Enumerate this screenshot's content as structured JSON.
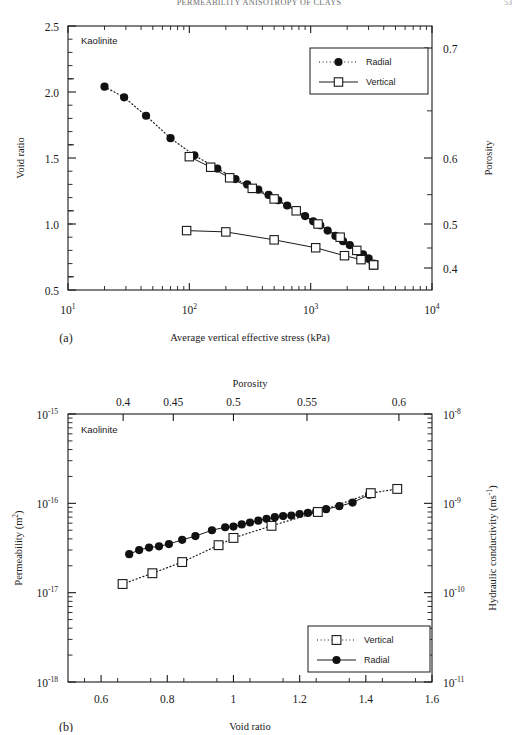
{
  "header": {
    "running_head": "PERMEABILITY ANISOTROPY OF CLAYS",
    "page_number": "53"
  },
  "panel_a": {
    "label": "(a)",
    "annotation": "Kaolinite",
    "x_axis": {
      "title": "Average vertical effective stress (kPa)",
      "scale": "log",
      "range": [
        10,
        10000
      ],
      "tick_labels": [
        "10",
        "10",
        "10",
        "10"
      ],
      "tick_exponents": [
        "1",
        "2",
        "3",
        "4"
      ]
    },
    "y_axis_left": {
      "title": "Void ratio",
      "range": [
        0.5,
        2.5
      ],
      "tick_labels": [
        "2.5",
        "2.0",
        "1.5",
        "1.0",
        "0.5"
      ],
      "tick_values": [
        2.5,
        2.0,
        1.5,
        1.0,
        0.5
      ],
      "minor_step": 0.1
    },
    "y_axis_right": {
      "title": "Porosity",
      "range": [
        0.3333,
        0.7143
      ],
      "tick_labels": [
        "0.7",
        "0.6",
        "0.5",
        "0.4"
      ],
      "tick_values": [
        0.7,
        0.6,
        0.5,
        0.4
      ],
      "minor_labels": [
        "0.65",
        "0.55",
        "0.45"
      ],
      "minor_values": [
        0.65,
        0.55,
        0.45
      ]
    },
    "legend": {
      "position": "top-right",
      "entries": [
        {
          "label": "Radial",
          "marker": "filled-circle",
          "line": "dotted"
        },
        {
          "label": "Vertical",
          "marker": "open-square",
          "line": "solid"
        }
      ]
    }
  },
  "panel_b": {
    "label": "(b)",
    "annotation": "Kaolinite",
    "x_axis_bottom": {
      "title": "Void ratio",
      "range": [
        0.5,
        1.6
      ],
      "tick_labels": [
        "0.6",
        "0.8",
        "1",
        "1.2",
        "1.4",
        "1.6"
      ],
      "tick_values": [
        0.6,
        0.8,
        1.0,
        1.2,
        1.4,
        1.6
      ],
      "minor_step": 0.05
    },
    "x_axis_top": {
      "title": "Porosity",
      "tick_labels": [
        "0.4",
        "0.45",
        "0.5",
        "0.55",
        "0.6"
      ],
      "tick_values": [
        0.4,
        0.45,
        0.5,
        0.55,
        0.6
      ]
    },
    "y_axis_left": {
      "title": "Permeability (m",
      "title_sup": "2",
      "title_tail": ")",
      "scale": "log",
      "range": [
        1e-18,
        1e-15
      ],
      "tick_labels": [
        "10",
        "10",
        "10",
        "10"
      ],
      "tick_exponents": [
        "-15",
        "-16",
        "-17",
        "-18"
      ]
    },
    "y_axis_right": {
      "title": "Hydraulic conductivity (ms",
      "title_sup": "-1",
      "title_tail": ")",
      "scale": "log",
      "tick_labels": [
        "10",
        "10",
        "10",
        "10"
      ],
      "tick_exponents": [
        "-8",
        "-9",
        "-10",
        "-11"
      ]
    },
    "legend": {
      "position": "bottom-right",
      "entries": [
        {
          "label": "Vertical",
          "marker": "open-square",
          "line": "dotted"
        },
        {
          "label": "Radial",
          "marker": "filled-circle",
          "line": "solid"
        }
      ]
    }
  },
  "colors": {
    "ink": "#1a1a1a",
    "axis": "#1a1a1a",
    "marker_fill": "#111111",
    "marker_open": "#ffffff",
    "background": "#ffffff"
  },
  "chart_data": [
    {
      "type": "scatter",
      "panel": "a",
      "title": "Void ratio vs average vertical effective stress",
      "xlabel": "Average vertical effective stress (kPa)",
      "ylabel": "Void ratio",
      "y2label": "Porosity",
      "xscale": "log",
      "xlim": [
        10,
        10000
      ],
      "ylim": [
        0.5,
        2.5
      ],
      "grid": false,
      "legend_position": "top-right",
      "annotation": "Kaolinite",
      "series": [
        {
          "name": "Radial",
          "marker": "filled-circle",
          "line": "dotted",
          "x": [
            20,
            29,
            44,
            70,
            110,
            170,
            240,
            300,
            370,
            450,
            540,
            640,
            760,
            900,
            1050,
            1200,
            1380,
            1600,
            1850,
            2100,
            2400,
            2700,
            3000,
            3300
          ],
          "y": [
            2.04,
            1.96,
            1.82,
            1.65,
            1.52,
            1.42,
            1.34,
            1.3,
            1.26,
            1.22,
            1.18,
            1.14,
            1.1,
            1.06,
            1.02,
            0.99,
            0.95,
            0.91,
            0.87,
            0.84,
            0.8,
            0.77,
            0.74,
            0.7
          ]
        },
        {
          "name": "Vertical",
          "marker": "open-square",
          "line": "solid",
          "x": [
            100,
            150,
            215,
            330,
            500,
            760,
            1150,
            1750,
            2400,
            3300
          ],
          "y": [
            1.51,
            1.43,
            1.35,
            1.27,
            1.19,
            1.1,
            1.0,
            0.9,
            0.8,
            0.69
          ]
        },
        {
          "name": "Vertical-rebound",
          "marker": "open-square",
          "line": "solid",
          "x": [
            95,
            200,
            500,
            1100,
            1900,
            2600,
            3300
          ],
          "y": [
            0.95,
            0.94,
            0.88,
            0.82,
            0.76,
            0.73,
            0.69
          ]
        }
      ]
    },
    {
      "type": "scatter",
      "panel": "b",
      "title": "Permeability vs void ratio",
      "xlabel": "Void ratio",
      "x2label": "Porosity",
      "ylabel": "Permeability (m2)",
      "y2label": "Hydraulic conductivity (ms-1)",
      "yscale": "log",
      "xlim": [
        0.5,
        1.6
      ],
      "ylim": [
        1e-18,
        1e-15
      ],
      "grid": false,
      "legend_position": "bottom-right",
      "annotation": "Kaolinite",
      "series": [
        {
          "name": "Radial",
          "marker": "filled-circle",
          "line": "solid",
          "x": [
            0.685,
            0.715,
            0.745,
            0.775,
            0.805,
            0.845,
            0.885,
            0.935,
            0.975,
            1.0,
            1.025,
            1.05,
            1.075,
            1.1,
            1.125,
            1.15,
            1.175,
            1.2,
            1.225,
            1.25,
            1.28,
            1.32,
            1.36,
            1.41
          ],
          "y": [
            2.7e-17,
            3e-17,
            3.2e-17,
            3.3e-17,
            3.5e-17,
            3.9e-17,
            4.3e-17,
            5e-17,
            5.4e-17,
            5.5e-17,
            5.8e-17,
            6.1e-17,
            6.4e-17,
            6.7e-17,
            7e-17,
            7.2e-17,
            7.3e-17,
            7.6e-17,
            7.8e-17,
            8.1e-17,
            8.6e-17,
            9.3e-17,
            1.02e-16,
            1.25e-16
          ]
        },
        {
          "name": "Vertical",
          "marker": "open-square",
          "line": "dotted",
          "x": [
            0.665,
            0.755,
            0.845,
            0.955,
            1.0,
            1.115,
            1.255,
            1.415,
            1.495
          ],
          "y": [
            1.25e-17,
            1.65e-17,
            2.2e-17,
            3.4e-17,
            4.1e-17,
            5.6e-17,
            8e-17,
            1.3e-16,
            1.45e-16
          ]
        }
      ]
    }
  ]
}
